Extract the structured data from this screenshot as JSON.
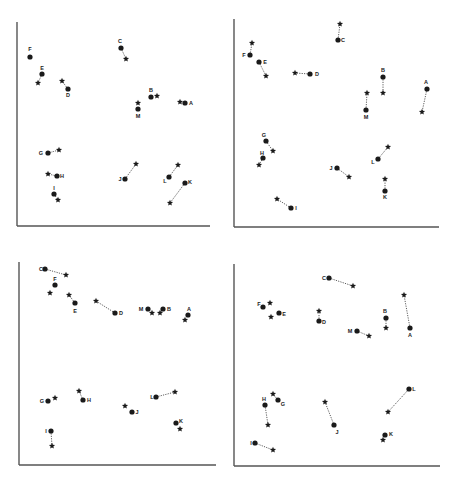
{
  "colors": {
    "ink": "#1a1a1a",
    "axis": "#555555",
    "line": "#333333",
    "bg": "#ffffff"
  },
  "chart_data": [
    {
      "type": "scatter",
      "panel": "top-left",
      "title": "",
      "xlabel": "",
      "ylabel": "",
      "grid": false,
      "legend": {
        "circle": "dot-marker",
        "star": "star-marker"
      },
      "offset": [
        0,
        0
      ],
      "axes": {
        "x0": 17,
        "y0": 226,
        "x1": 210,
        "ytop": 22
      },
      "points": [
        {
          "label": "A",
          "dot": [
            185,
            103
          ],
          "star": [
            180,
            102
          ],
          "lab": [
            191,
            103
          ],
          "connected": false
        },
        {
          "label": "B",
          "dot": [
            151,
            97
          ],
          "star": [
            157,
            96
          ],
          "lab": [
            151,
            90
          ],
          "connected": false
        },
        {
          "label": "C",
          "dot": [
            121,
            48
          ],
          "star": [
            126,
            59
          ],
          "lab": [
            120,
            41
          ],
          "connected": true
        },
        {
          "label": "D",
          "dot": [
            68,
            89
          ],
          "star": [
            62,
            81
          ],
          "lab": [
            68,
            95
          ],
          "connected": true
        },
        {
          "label": "E",
          "dot": [
            42,
            74
          ],
          "star": [
            38,
            83
          ],
          "lab": [
            42,
            68
          ],
          "connected": true
        },
        {
          "label": "F",
          "dot": [
            30,
            57
          ],
          "star": null,
          "lab": [
            30,
            49
          ],
          "connected": false
        },
        {
          "label": "G",
          "dot": [
            48,
            153
          ],
          "star": [
            59,
            150
          ],
          "lab": [
            41,
            153
          ],
          "connected": true
        },
        {
          "label": "H",
          "dot": [
            57,
            176
          ],
          "star": [
            48,
            174
          ],
          "lab": [
            62,
            176
          ],
          "connected": true
        },
        {
          "label": "I",
          "dot": [
            54,
            194
          ],
          "star": [
            58,
            200
          ],
          "lab": [
            54,
            188
          ],
          "connected": true
        },
        {
          "label": "J",
          "dot": [
            125,
            179
          ],
          "star": [
            136,
            164
          ],
          "lab": [
            120,
            179
          ],
          "connected": true
        },
        {
          "label": "K",
          "dot": [
            185,
            183
          ],
          "star": [
            170,
            203
          ],
          "lab": [
            190,
            182
          ],
          "connected": true
        },
        {
          "label": "L",
          "dot": [
            169,
            177
          ],
          "star": [
            178,
            165
          ],
          "lab": [
            165,
            181
          ],
          "connected": true
        },
        {
          "label": "M",
          "dot": [
            138,
            109
          ],
          "star": [
            138,
            103
          ],
          "lab": [
            138,
            116
          ],
          "connected": false
        }
      ]
    },
    {
      "type": "scatter",
      "panel": "top-right",
      "title": "",
      "xlabel": "",
      "ylabel": "",
      "grid": false,
      "offset": [
        225,
        0
      ],
      "axes": {
        "x0": 9,
        "y0": 227,
        "x1": 214,
        "ytop": 19
      },
      "points": [
        {
          "label": "A",
          "dot": [
            202,
            89
          ],
          "star": [
            197,
            112
          ],
          "lab": [
            201,
            82
          ],
          "connected": true
        },
        {
          "label": "B",
          "dot": [
            158,
            77
          ],
          "star": [
            158,
            93
          ],
          "lab": [
            158,
            70
          ],
          "connected": true
        },
        {
          "label": "C",
          "dot": [
            113,
            40
          ],
          "star": [
            115,
            24
          ],
          "lab": [
            118,
            40
          ],
          "connected": true
        },
        {
          "label": "D",
          "dot": [
            85,
            74
          ],
          "star": [
            70,
            73
          ],
          "lab": [
            92,
            74
          ],
          "connected": true
        },
        {
          "label": "E",
          "dot": [
            34,
            62
          ],
          "star": [
            41,
            76
          ],
          "lab": [
            40,
            62
          ],
          "connected": true
        },
        {
          "label": "F",
          "dot": [
            25,
            55
          ],
          "star": [
            27,
            43
          ],
          "lab": [
            19,
            55
          ],
          "connected": true
        },
        {
          "label": "G",
          "dot": [
            41,
            141
          ],
          "star": [
            48,
            151
          ],
          "lab": [
            39,
            135
          ],
          "connected": true
        },
        {
          "label": "H",
          "dot": [
            38,
            158
          ],
          "star": [
            34,
            165
          ],
          "lab": [
            37,
            153
          ],
          "connected": true
        },
        {
          "label": "I",
          "dot": [
            66,
            208
          ],
          "star": [
            52,
            199
          ],
          "lab": [
            71,
            208
          ],
          "connected": true
        },
        {
          "label": "J",
          "dot": [
            112,
            168
          ],
          "star": [
            124,
            177
          ],
          "lab": [
            106,
            168
          ],
          "connected": true
        },
        {
          "label": "K",
          "dot": [
            160,
            191
          ],
          "star": [
            160,
            179
          ],
          "lab": [
            160,
            197
          ],
          "connected": true
        },
        {
          "label": "L",
          "dot": [
            153,
            159
          ],
          "star": [
            163,
            147
          ],
          "lab": [
            148,
            162
          ],
          "connected": true
        },
        {
          "label": "M",
          "dot": [
            141,
            110
          ],
          "star": [
            142,
            93
          ],
          "lab": [
            141,
            117
          ],
          "connected": true
        }
      ]
    },
    {
      "type": "scatter",
      "panel": "bottom-left",
      "title": "",
      "xlabel": "",
      "ylabel": "",
      "grid": false,
      "offset": [
        0,
        240
      ],
      "axes": {
        "x0": 19,
        "y0": 225,
        "x1": 216,
        "ytop": 22
      },
      "points": [
        {
          "label": "A",
          "dot": [
            188,
            75
          ],
          "star": [
            185,
            80
          ],
          "lab": [
            189,
            69
          ],
          "connected": false
        },
        {
          "label": "B",
          "dot": [
            163,
            69
          ],
          "star": [
            160,
            73
          ],
          "lab": [
            169,
            69
          ],
          "connected": true
        },
        {
          "label": "C",
          "dot": [
            45,
            29
          ],
          "star": [
            66,
            35
          ],
          "lab": [
            41,
            29
          ],
          "connected": true
        },
        {
          "label": "D",
          "dot": [
            115,
            73
          ],
          "star": [
            96,
            61
          ],
          "lab": [
            121,
            73
          ],
          "connected": true
        },
        {
          "label": "E",
          "dot": [
            75,
            63
          ],
          "star": [
            69,
            55
          ],
          "lab": [
            75,
            71
          ],
          "connected": true
        },
        {
          "label": "F",
          "dot": [
            55,
            45
          ],
          "star": [
            50,
            53
          ],
          "lab": [
            55,
            39
          ],
          "connected": false
        },
        {
          "label": "G",
          "dot": [
            48,
            161
          ],
          "star": [
            55,
            158
          ],
          "lab": [
            42,
            161
          ],
          "connected": false
        },
        {
          "label": "H",
          "dot": [
            83,
            160
          ],
          "star": [
            79,
            151
          ],
          "lab": [
            89,
            160
          ],
          "connected": true
        },
        {
          "label": "I",
          "dot": [
            51,
            191
          ],
          "star": [
            52,
            206
          ],
          "lab": [
            46,
            191
          ],
          "connected": true
        },
        {
          "label": "J",
          "dot": [
            132,
            172
          ],
          "star": [
            125,
            166
          ],
          "lab": [
            137,
            172
          ],
          "connected": false
        },
        {
          "label": "K",
          "dot": [
            176,
            183
          ],
          "star": [
            180,
            189
          ],
          "lab": [
            181,
            181
          ],
          "connected": false
        },
        {
          "label": "L",
          "dot": [
            156,
            157
          ],
          "star": [
            175,
            152
          ],
          "lab": [
            152,
            157
          ],
          "connected": true
        },
        {
          "label": "M",
          "dot": [
            148,
            69
          ],
          "star": [
            152,
            73
          ],
          "lab": [
            141,
            69
          ],
          "connected": false
        }
      ]
    },
    {
      "type": "scatter",
      "panel": "bottom-right",
      "title": "",
      "xlabel": "",
      "ylabel": "",
      "grid": false,
      "offset": [
        225,
        240
      ],
      "axes": {
        "x0": 9,
        "y0": 226,
        "x1": 215,
        "ytop": 24
      },
      "points": [
        {
          "label": "A",
          "dot": [
            185,
            88
          ],
          "star": [
            179,
            55
          ],
          "lab": [
            185,
            95
          ],
          "connected": true
        },
        {
          "label": "B",
          "dot": [
            161,
            78
          ],
          "star": [
            161,
            88
          ],
          "lab": [
            160,
            71
          ],
          "connected": true
        },
        {
          "label": "C",
          "dot": [
            104,
            38
          ],
          "star": [
            128,
            46
          ],
          "lab": [
            99,
            38
          ],
          "connected": true
        },
        {
          "label": "D",
          "dot": [
            94,
            81
          ],
          "star": [
            94,
            71
          ],
          "lab": [
            99,
            82
          ],
          "connected": true
        },
        {
          "label": "E",
          "dot": [
            54,
            73
          ],
          "star": [
            46,
            77
          ],
          "lab": [
            59,
            74
          ],
          "connected": false
        },
        {
          "label": "F",
          "dot": [
            38,
            67
          ],
          "star": [
            45,
            63
          ],
          "lab": [
            34,
            64
          ],
          "connected": false
        },
        {
          "label": "G",
          "dot": [
            53,
            160
          ],
          "star": [
            48,
            154
          ],
          "lab": [
            58,
            164
          ],
          "connected": true
        },
        {
          "label": "H",
          "dot": [
            40,
            165
          ],
          "star": [
            43,
            185
          ],
          "lab": [
            39,
            159
          ],
          "connected": true
        },
        {
          "label": "I",
          "dot": [
            30,
            203
          ],
          "star": [
            48,
            210
          ],
          "lab": [
            26,
            203
          ],
          "connected": true
        },
        {
          "label": "J",
          "dot": [
            109,
            185
          ],
          "star": [
            100,
            162
          ],
          "lab": [
            112,
            192
          ],
          "connected": true
        },
        {
          "label": "K",
          "dot": [
            160,
            195
          ],
          "star": [
            158,
            200
          ],
          "lab": [
            166,
            194
          ],
          "connected": false
        },
        {
          "label": "L",
          "dot": [
            184,
            149
          ],
          "star": [
            163,
            172
          ],
          "lab": [
            189,
            149
          ],
          "connected": true
        },
        {
          "label": "M",
          "dot": [
            132,
            91
          ],
          "star": [
            144,
            96
          ],
          "lab": [
            125,
            91
          ],
          "connected": true
        }
      ]
    }
  ]
}
